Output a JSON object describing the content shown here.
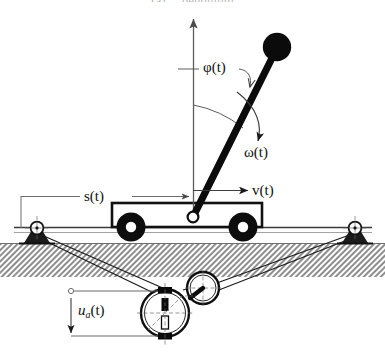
{
  "figure": {
    "top_caption": "(a) ... pendulum",
    "background_color": "#ffffff",
    "ink_color": "#000000",
    "thin_line_color": "#5a5a5a",
    "ground_color": "#9a9a9a"
  },
  "labels": {
    "angle": "φ(t)",
    "angular_velocity": "ω(t)",
    "cart_velocity": "v(t)",
    "cart_position": "s(t)",
    "armature_voltage_prefix": "u",
    "armature_voltage_subscript": "a",
    "armature_voltage_suffix": "(t)"
  },
  "components": {
    "pendulum_bob": "pendulum-bob",
    "pendulum_rod": "pendulum-rod",
    "pivot": "pendulum-pivot",
    "cart_body": "cart-body",
    "cart_wheel_left": "cart-wheel-left",
    "cart_wheel_right": "cart-wheel-right",
    "rail": "rail",
    "pulley_left": "idler-pulley-left",
    "pulley_right": "idler-pulley-right",
    "drive_belt": "drive-belt",
    "dc_motor": "dc-motor",
    "motor_drive_pulley": "motor-drive-pulley",
    "ground": "ground-hatching",
    "vertical_axis": "vertical-reference-axis"
  },
  "geometry": {
    "pivot_x": 193,
    "pivot_y": 217,
    "bob_x": 277,
    "bob_y": 47,
    "bob_radius": 14,
    "axis_top_y": 14,
    "rail_y": 227,
    "ground_top_y": 243,
    "ground_bottom_y": 277,
    "pulley_left_x": 37,
    "pulley_right_x": 355,
    "motor_x": 165,
    "motor_y": 313,
    "motor_radius": 24,
    "drive_pulley_x": 203,
    "drive_pulley_y": 288,
    "drive_pulley_radius": 16,
    "angle_degrees": 26
  }
}
